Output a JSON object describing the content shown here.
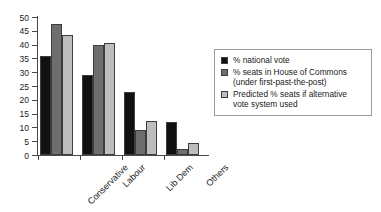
{
  "chart_data": {
    "type": "bar",
    "title": "",
    "xlabel": "",
    "ylabel": "",
    "ylim": [
      0,
      50
    ],
    "ytick_step": 5,
    "yticks": [
      50,
      45,
      40,
      35,
      30,
      25,
      20,
      15,
      10,
      5,
      0
    ],
    "grid": false,
    "legend_position": "right",
    "categories": [
      "Conservative",
      "Labour",
      "Lib Dem",
      "Others"
    ],
    "series": [
      {
        "name": "% national vote",
        "color": "#111111",
        "values": [
          36,
          29,
          23,
          12
        ]
      },
      {
        "name": "% seats in House of Commons (under first-past-the-post)",
        "color": "#6e6e6e",
        "values": [
          47.5,
          40,
          9,
          2
        ]
      },
      {
        "name": "Predicted % seats if alternative vote system used",
        "color": "#bdbdbd",
        "values": [
          43.5,
          40.5,
          12.5,
          4.5
        ]
      }
    ]
  },
  "legend": {
    "items": [
      {
        "swatch": "s0",
        "line1": "% national vote",
        "line2": ""
      },
      {
        "swatch": "s1",
        "line1": "% seats in House of Commons",
        "line2": "(under first-past-the-post)"
      },
      {
        "swatch": "s2",
        "line1": "Predicted % seats if alternative",
        "line2": "vote system used"
      }
    ]
  }
}
